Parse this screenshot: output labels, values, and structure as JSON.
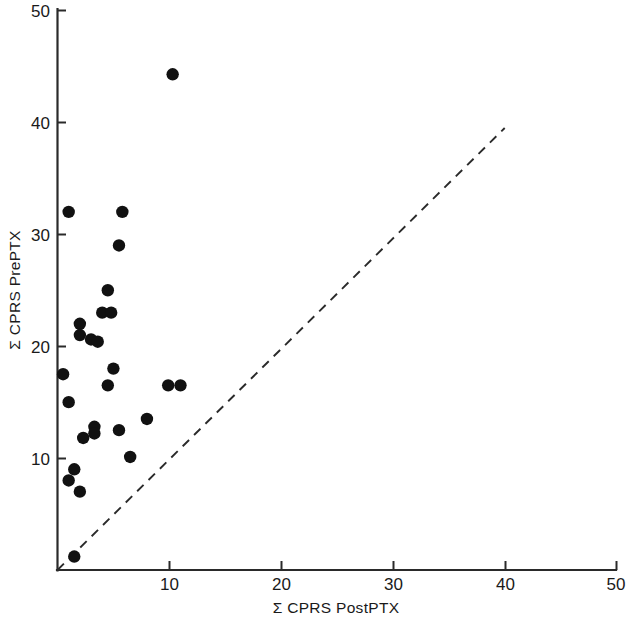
{
  "chart_data": {
    "type": "scatter",
    "title": "",
    "subtitle": "",
    "xlabel": "Σ CPRS PostPTX",
    "ylabel": "Σ CPRS PrePTX",
    "xlim": [
      0,
      50
    ],
    "ylim": [
      0,
      50
    ],
    "xticks": [
      10,
      20,
      30,
      40,
      50
    ],
    "xtick_labels": [
      "10",
      "20",
      "30",
      "40",
      "50"
    ],
    "yticks": [
      10,
      20,
      30,
      40,
      50
    ],
    "ytick_labels": [
      "10",
      "20",
      "30",
      "40",
      "50"
    ],
    "grid": false,
    "legend": null,
    "marker": "filled-circle",
    "marker_color": "#111111",
    "series": [
      {
        "name": "patients",
        "points": [
          [
            10.3,
            44.3
          ],
          [
            1.0,
            32.0
          ],
          [
            5.8,
            32.0
          ],
          [
            5.5,
            29.0
          ],
          [
            4.5,
            25.0
          ],
          [
            4.0,
            23.0
          ],
          [
            4.8,
            23.0
          ],
          [
            2.0,
            22.0
          ],
          [
            2.0,
            21.0
          ],
          [
            3.0,
            20.6
          ],
          [
            3.6,
            20.4
          ],
          [
            5.0,
            18.0
          ],
          [
            0.5,
            17.5
          ],
          [
            4.5,
            16.5
          ],
          [
            9.9,
            16.5
          ],
          [
            11.0,
            16.5
          ],
          [
            1.0,
            15.0
          ],
          [
            8.0,
            13.5
          ],
          [
            3.3,
            12.8
          ],
          [
            3.3,
            12.2
          ],
          [
            5.5,
            12.5
          ],
          [
            2.3,
            11.8
          ],
          [
            6.5,
            10.1
          ],
          [
            1.5,
            9.0
          ],
          [
            1.0,
            8.0
          ],
          [
            2.0,
            7.0
          ],
          [
            1.5,
            1.2
          ]
        ]
      }
    ],
    "annotations": [
      {
        "name": "identity-reference-line",
        "type": "dashed-line",
        "from": [
          0,
          0
        ],
        "to": [
          40,
          39.5
        ],
        "style": "dashed",
        "color": "#2a2a2a"
      }
    ]
  }
}
